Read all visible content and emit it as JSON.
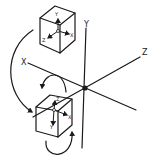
{
  "diagram": {
    "type": "3d-coordinate-rotation",
    "world_axes": {
      "x_label": "X",
      "y_label": "Y",
      "z_label": "Z"
    },
    "top_cube": {
      "x_label": "X",
      "y_label": "Y",
      "z_label": "Z"
    },
    "bottom_cube": {
      "x_label": "X",
      "y_label": "Y",
      "z_label": "Z"
    },
    "colors": {
      "ink": "#1a1a1a",
      "background": "#ffffff"
    }
  }
}
